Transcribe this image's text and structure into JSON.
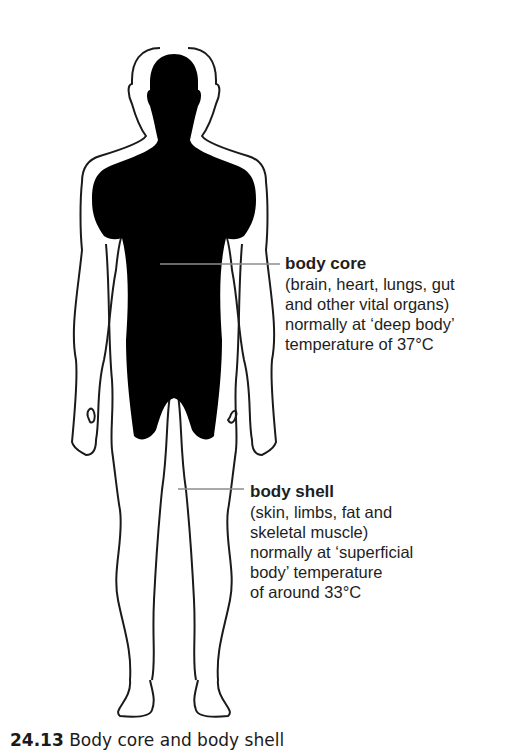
{
  "diagram": {
    "type": "anatomical body outline",
    "colors": {
      "core_fill": "#000000",
      "outline": "#1a1a1a",
      "leader_line": "#8c8c8c",
      "background": "#ffffff"
    }
  },
  "labels": {
    "core": {
      "title": "body core",
      "lines": [
        "(brain, heart, lungs, gut",
        "and other vital organs)",
        "normally at ‘deep body’",
        "temperature of 37°C"
      ]
    },
    "shell": {
      "title": "body shell",
      "lines": [
        "(skin, limbs, fat and",
        "skeletal muscle)",
        "normally at ‘superficial",
        "body’ temperature",
        "of around 33°C"
      ]
    }
  },
  "caption": {
    "number": "24.13",
    "text": "Body core and body shell"
  }
}
